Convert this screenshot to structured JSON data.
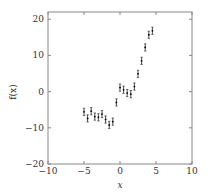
{
  "chart_data": {
    "type": "scatter",
    "title": "",
    "xlabel": "x",
    "ylabel": "f(x)",
    "xlim": [
      -10,
      10
    ],
    "ylim": [
      -20,
      22
    ],
    "xticks": [
      "−10",
      "−5",
      "0",
      "5",
      "10"
    ],
    "yticks": [
      "−20",
      "−10",
      "0",
      "10",
      "20"
    ],
    "grid": false,
    "legend": null,
    "series": [
      {
        "name": "f(x) with error bars",
        "x": [
          -5,
          -4.5,
          -4,
          -3.5,
          -3,
          -2.5,
          -2,
          -1.5,
          -1,
          -0.5,
          0,
          0.5,
          1,
          1.5,
          2,
          2.5,
          3,
          3.5,
          4,
          4.5
        ],
        "y": [
          -5.6,
          -7.4,
          -5.4,
          -6.9,
          -7.1,
          -6.2,
          -7.7,
          -9.2,
          -8.3,
          -3.0,
          1.1,
          0.5,
          -0.4,
          -0.7,
          1.4,
          4.9,
          8.5,
          12.2,
          15.7,
          16.8
        ],
        "error": 1.0
      }
    ]
  }
}
